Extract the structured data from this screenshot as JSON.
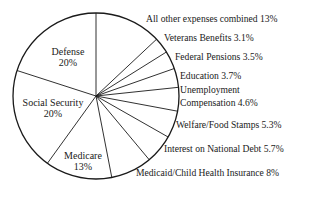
{
  "chart_data": {
    "type": "pie",
    "title": "",
    "start_angle_deg": 0,
    "direction": "clockwise",
    "slices": [
      {
        "label": "All other expenses combined",
        "value": 13,
        "display": "All other expenses combined 13%"
      },
      {
        "label": "Veterans Benefits",
        "value": 3.1,
        "display": "Veterans Benefits 3.1%"
      },
      {
        "label": "Federal Pensions",
        "value": 3.5,
        "display": "Federal Pensions 3.5%"
      },
      {
        "label": "Education",
        "value": 3.7,
        "display": "Education 3.7%"
      },
      {
        "label": "Unemployment Compensation",
        "value": 4.6,
        "display": "Unemployment Compensation 4.6%"
      },
      {
        "label": "Welfare/Food Stamps",
        "value": 5.3,
        "display": "Welfare/Food Stamps 5.3%"
      },
      {
        "label": "Interest on National Debt",
        "value": 5.7,
        "display": "Interest on National Debt 5.7%"
      },
      {
        "label": "Medicaid/Child Health Insurance",
        "value": 8,
        "display": "Medicaid/Child Health Insurance 8%"
      },
      {
        "label": "Medicare",
        "value": 13,
        "display": "Medicare 13%"
      },
      {
        "label": "Social Security",
        "value": 20,
        "display": "Social Security 20%"
      },
      {
        "label": "Defense",
        "value": 20,
        "display": "Defense 20%"
      }
    ]
  },
  "labels": {
    "defense": {
      "name": "Defense",
      "pct": "20%"
    },
    "social_security": {
      "name": "Social Security",
      "pct": "20%"
    },
    "medicare": {
      "name": "Medicare",
      "pct": "13%"
    },
    "all_other": "All other expenses combined 13%",
    "veterans": "Veterans Benefits 3.1%",
    "pensions": "Federal Pensions 3.5%",
    "education": "Education 3.7%",
    "unemployment_1": "Unemployment",
    "unemployment_2": "Compensation 4.6%",
    "welfare": "Welfare/Food Stamps 5.3%",
    "interest": "Interest on National Debt 5.7%",
    "medicaid": "Medicaid/Child Health Insurance 8%"
  }
}
